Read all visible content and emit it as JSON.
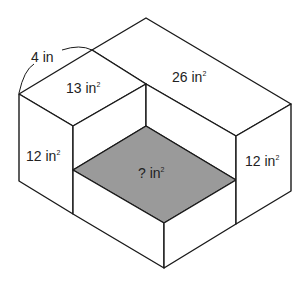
{
  "diagram": {
    "type": "isometric-composite-rectangular-prism",
    "labels": {
      "edge_length": {
        "value": "4",
        "unit": "in"
      },
      "left_top_face": {
        "value": "13",
        "unit": "in",
        "exponent": "2"
      },
      "back_top_face": {
        "value": "26",
        "unit": "in",
        "exponent": "2"
      },
      "left_front_face": {
        "value": "12",
        "unit": "in",
        "exponent": "2"
      },
      "right_side_face": {
        "value": "12",
        "unit": "in",
        "exponent": "2"
      },
      "shaded_face": {
        "value": "?",
        "unit": "in",
        "exponent": "2"
      }
    },
    "colors": {
      "line": "#1a1a1a",
      "shaded_face": "#9a9a9a",
      "background": "#ffffff"
    }
  }
}
